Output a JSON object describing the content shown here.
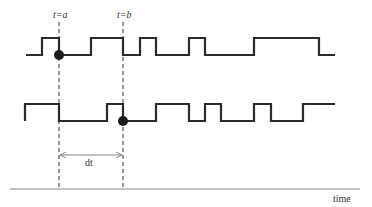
{
  "diagram": {
    "markers": [
      {
        "label": "t=a",
        "x": 59
      },
      {
        "label": "t=b",
        "x": 123
      }
    ],
    "signals": [
      {
        "name": "signal-1",
        "high_y": 38,
        "low_y": 55,
        "path": "M26,55 H42 V38 H59 V55 H91 V38 H123 V55 H140 V38 H156 V55 H189 V38 H205 V55 H254 V38 H319 V55 H335",
        "event_point": {
          "x": 59,
          "y": 55
        }
      },
      {
        "name": "signal-2",
        "high_y": 104,
        "low_y": 121,
        "path": "M25,121 V104 H59 V121 H107 V104 H123 V121 H156 V104 H189 V121 H205 V104 H221 V121 H254 V104 H271 V121 H303 V104 H335",
        "event_point": {
          "x": 123,
          "y": 121
        }
      }
    ],
    "interval_label": "dt",
    "axis_label": "time",
    "colors": {
      "line": "#2b2b2b",
      "axis": "#888888",
      "background": "#ffffff"
    }
  }
}
